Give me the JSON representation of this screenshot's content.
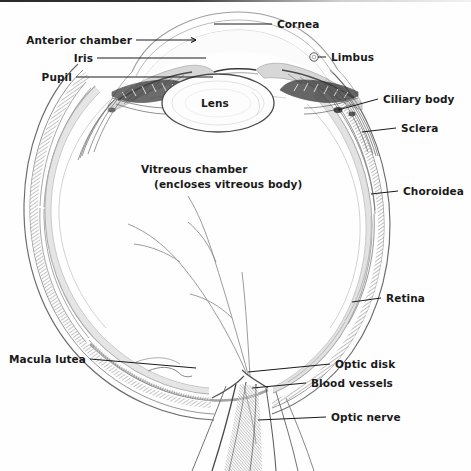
{
  "diagram": {
    "style": "pencil line drawing, grayscale",
    "canvas": {
      "width": 471,
      "height": 471
    },
    "background_color": "#fefefe",
    "ink_color": "#555555",
    "label_color": "#1a1a1a"
  },
  "labels": {
    "cornea": "Cornea",
    "anterior_chamber": "Anterior chamber",
    "iris": "Iris",
    "pupil": "Pupil",
    "limbus": "Limbus",
    "ciliary_body": "Ciliary body",
    "sclera": "Sclera",
    "choroidea": "Choroidea",
    "retina": "Retina",
    "lens": "Lens",
    "vitreous_chamber_line1": "Vitreous chamber",
    "vitreous_chamber_line2": "(encloses vitreous body)",
    "macula_lutea": "Macula lutea",
    "optic_disk": "Optic disk",
    "blood_vessels": "Blood vessels",
    "optic_nerve": "Optic nerve"
  }
}
